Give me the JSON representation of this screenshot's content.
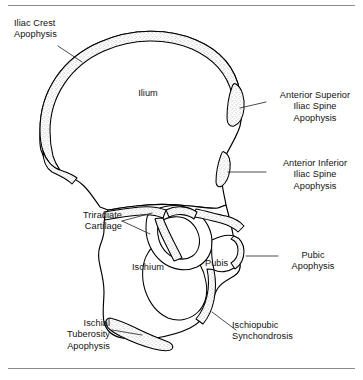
{
  "figure": {
    "background_color": "#ffffff",
    "line_color": "#000000",
    "stipple_color": "#8d8d8d"
  },
  "callout_labels": [
    {
      "id": "iliac-crest-apophysis",
      "text": "Iliac Crest\nApophysis"
    },
    {
      "id": "anterior-superior-iliac-spine-apophysis",
      "text": "Anterior Superior\nIliac Spine\nApophysis"
    },
    {
      "id": "anterior-inferior-iliac-spine-apophysis",
      "text": "Anterior Inferior\nIliac Spine\nApophysis"
    },
    {
      "id": "triradiate-cartilage",
      "text": "Triradiate\nCartilage"
    },
    {
      "id": "pubic-apophysis",
      "text": "Pubic\nApophysis"
    },
    {
      "id": "ischiopubic-synchondrosis",
      "text": "Ischiopubic\nSynchondrosis"
    },
    {
      "id": "ischial-tuberosity-apophysis",
      "text": "Ischial\nTuberosity\nApophysis"
    }
  ],
  "bone_labels": [
    {
      "id": "ilium",
      "text": "Ilium"
    },
    {
      "id": "ischium",
      "text": "Ischium"
    },
    {
      "id": "pubis",
      "text": "Pubis"
    }
  ],
  "labels": {
    "iliac_crest": "Iliac Crest\nApophysis",
    "asis": "Anterior Superior\nIliac Spine\nApophysis",
    "aiis": "Anterior Inferior\nIliac Spine\nApophysis",
    "triradiate": "Triradiate\nCartilage",
    "pubic": "Pubic\nApophysis",
    "ischiopubic": "Ischiopubic\nSynchondrosis",
    "ischial_tuberosity": "Ischial\nTuberosity\nApophysis",
    "ilium": "Ilium",
    "ischium": "Ischium",
    "pubis": "Pubis"
  }
}
